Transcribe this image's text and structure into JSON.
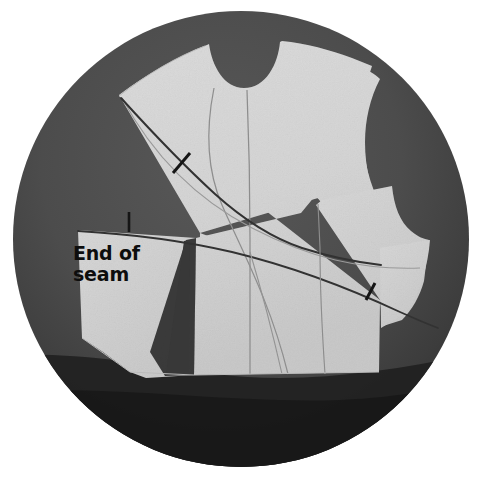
{
  "figure": {
    "kind": "sewing-pattern-photo",
    "shape": "circular-vignette",
    "title_visible": false,
    "annotations": [
      {
        "id": "end-of-seam",
        "text": "End of\nseam",
        "line1": "End of",
        "line2": "seam",
        "x": 73,
        "y": 243,
        "points_to_marker": "tick-mark-left"
      }
    ],
    "markers": [
      {
        "id": "tick-mark-left",
        "label": "seam-end-tick",
        "x": 129,
        "y": 222,
        "angle_deg": 90,
        "length": 20
      },
      {
        "id": "tick-mark-upper",
        "label": "notch-tick-upper",
        "x": 181,
        "y": 163,
        "angle_deg": -55,
        "length": 22
      },
      {
        "id": "tick-mark-lower",
        "label": "notch-tick-lower",
        "x": 371,
        "y": 292,
        "angle_deg": -70,
        "length": 22
      }
    ]
  },
  "colors": {
    "background": "#ffffff",
    "vignette_dark": "#4c4c4c",
    "vignette_shadow": "#232323",
    "pattern_paper": "#d9d9d9",
    "pattern_paper_shade": "#cfcfcf",
    "seam_line_heavy": "#2b2b2b",
    "seam_line_light": "#8a8a8a",
    "text": "#0d0d0d"
  },
  "circle": {
    "center_x": 241,
    "center_y": 239,
    "radius": 228
  },
  "pattern_pieces": [
    {
      "id": "bodice-front-main",
      "name": "bodice-front-main-panel"
    },
    {
      "id": "lower-left-panel",
      "name": "lower-left-side-panel"
    },
    {
      "id": "right-side-panel",
      "name": "right-under-arm-panel"
    }
  ],
  "seam_lines": [
    {
      "id": "princess-seam-diagonal",
      "style": "heavy",
      "name": "diagonal-princess-seam"
    },
    {
      "id": "center-front-line",
      "style": "light",
      "name": "center-front-grainline"
    },
    {
      "id": "neck-dart-curve",
      "style": "light",
      "name": "neckline-dart-curve"
    },
    {
      "id": "waist-seam-line",
      "style": "heavy",
      "name": "horizontal-waist-seam"
    },
    {
      "id": "side-seam-curve",
      "style": "light",
      "name": "side-seam-curve"
    }
  ]
}
